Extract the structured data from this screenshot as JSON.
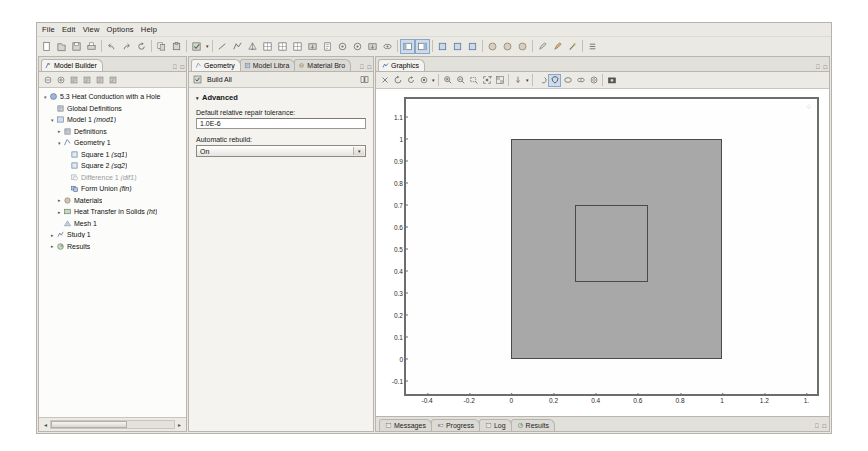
{
  "app": {
    "title": "COMSOL Multiphysics"
  },
  "menubar": {
    "items": [
      {
        "label": "File",
        "name": "menu-file"
      },
      {
        "label": "Edit",
        "name": "menu-edit"
      },
      {
        "label": "View",
        "name": "menu-view"
      },
      {
        "label": "Options",
        "name": "menu-options"
      },
      {
        "label": "Help",
        "name": "menu-help"
      }
    ]
  },
  "toolbar": {
    "groups": [
      {
        "buttons": [
          {
            "icon": "new-file-icon",
            "label": "New"
          },
          {
            "icon": "open-file-icon",
            "label": "Open"
          },
          {
            "icon": "save-icon",
            "label": "Save"
          },
          {
            "icon": "print-icon",
            "label": "Print"
          }
        ]
      },
      {
        "buttons": [
          {
            "icon": "undo-icon",
            "label": "Undo"
          },
          {
            "icon": "redo-icon",
            "label": "Redo"
          },
          {
            "icon": "refresh-icon",
            "label": "Refresh"
          }
        ]
      },
      {
        "buttons": [
          {
            "icon": "copy-icon",
            "label": "Copy"
          },
          {
            "icon": "paste-icon",
            "label": "Paste"
          }
        ]
      },
      {
        "buttons": [
          {
            "icon": "build-icon",
            "label": "Build"
          }
        ],
        "caret": true
      },
      {
        "buttons": [
          {
            "icon": "line-tool-icon",
            "label": "Line"
          },
          {
            "icon": "polygon-tool-icon",
            "label": "Polygon"
          },
          {
            "icon": "mesh-tool-icon",
            "label": "Mesh"
          },
          {
            "icon": "plot-1-icon",
            "label": "Plot"
          },
          {
            "icon": "plot-2-icon",
            "label": "Plot Group"
          },
          {
            "icon": "table-icon",
            "label": "Table"
          },
          {
            "icon": "export-icon",
            "label": "Export"
          },
          {
            "icon": "report-icon",
            "label": "Report"
          },
          {
            "icon": "probe-icon",
            "label": "Probe"
          },
          {
            "icon": "target-icon",
            "label": "Target"
          },
          {
            "icon": "import-icon",
            "label": "Import"
          },
          {
            "icon": "eye-icon",
            "label": "Show"
          }
        ]
      },
      {
        "buttons": [
          {
            "icon": "view-split-left-icon",
            "label": "Split Left",
            "active": true
          },
          {
            "icon": "view-split-right-icon",
            "label": "Split Right",
            "active": true
          }
        ]
      },
      {
        "buttons": [
          {
            "icon": "geom-1-icon",
            "label": "Geometry"
          },
          {
            "icon": "geom-2-icon",
            "label": "Geometry Sequence"
          },
          {
            "icon": "geom-3-icon",
            "label": "Work Plane"
          }
        ]
      },
      {
        "buttons": [
          {
            "icon": "material-1-icon",
            "label": "Material"
          },
          {
            "icon": "material-2-icon",
            "label": "Material Browser"
          },
          {
            "icon": "material-3-icon",
            "label": "Add Material"
          }
        ]
      },
      {
        "buttons": [
          {
            "icon": "pencil-icon",
            "label": "Edit"
          },
          {
            "icon": "brush-icon",
            "label": "Paint"
          },
          {
            "icon": "wand-icon",
            "label": "Select"
          }
        ]
      },
      {
        "buttons": [
          {
            "icon": "list-icon",
            "label": "List"
          }
        ]
      }
    ]
  },
  "model_builder": {
    "tab": {
      "label": "Model Builder",
      "icon": "model-builder-icon"
    },
    "tools": [
      {
        "icon": "collapse-icon",
        "label": "Collapse All"
      },
      {
        "icon": "expand-icon",
        "label": "Expand All"
      },
      {
        "icon": "tree-node-1-icon",
        "label": "Show Node"
      },
      {
        "icon": "tree-node-2-icon",
        "label": "Hide Node"
      },
      {
        "icon": "tree-node-3-icon",
        "label": "Node Options"
      },
      {
        "icon": "tree-node-4-icon",
        "label": "Tree Settings"
      }
    ],
    "tree": [
      {
        "indent": 0,
        "twist": "open",
        "icon": "model-root-icon",
        "label": "5.3 Heat Conduction with a Hole_",
        "name": "tree-item-root"
      },
      {
        "indent": 1,
        "twist": "none",
        "icon": "global-def-icon",
        "label": "Global Definitions",
        "name": "tree-item-global-definitions"
      },
      {
        "indent": 1,
        "twist": "open",
        "icon": "model-node-icon",
        "label": "Model 1 (mod1)",
        "name": "tree-item-model-1"
      },
      {
        "indent": 2,
        "twist": "closed",
        "icon": "definitions-icon",
        "label": "Definitions",
        "name": "tree-item-definitions"
      },
      {
        "indent": 2,
        "twist": "open",
        "icon": "geometry-icon",
        "label": "Geometry 1",
        "name": "tree-item-geometry-1"
      },
      {
        "indent": 3,
        "twist": "none",
        "icon": "square-icon",
        "label": "Square 1 (sq1)",
        "name": "tree-item-square-1"
      },
      {
        "indent": 3,
        "twist": "none",
        "icon": "square-icon",
        "label": "Square 2 (sq2)",
        "name": "tree-item-square-2"
      },
      {
        "indent": 3,
        "twist": "none",
        "icon": "difference-icon",
        "label": "Difference 1 (dif1)",
        "name": "tree-item-difference-1",
        "dim": true
      },
      {
        "indent": 3,
        "twist": "none",
        "icon": "form-union-icon",
        "label": "Form Union (fin)",
        "name": "tree-item-form-union"
      },
      {
        "indent": 2,
        "twist": "closed",
        "icon": "materials-icon",
        "label": "Materials",
        "name": "tree-item-materials"
      },
      {
        "indent": 2,
        "twist": "closed",
        "icon": "physics-icon",
        "label": "Heat Transfer in Solids (ht)",
        "name": "tree-item-heat-transfer"
      },
      {
        "indent": 2,
        "twist": "none",
        "icon": "mesh-icon",
        "label": "Mesh 1",
        "name": "tree-item-mesh-1"
      },
      {
        "indent": 1,
        "twist": "closed",
        "icon": "study-icon",
        "label": "Study 1",
        "name": "tree-item-study-1"
      },
      {
        "indent": 1,
        "twist": "closed",
        "icon": "results-icon",
        "label": "Results",
        "name": "tree-item-results"
      }
    ]
  },
  "settings": {
    "tabs": [
      {
        "label": "Geometry",
        "icon": "geometry-icon",
        "active": true,
        "name": "tab-geometry"
      },
      {
        "label": "Model Libra",
        "icon": "model-library-icon",
        "active": false,
        "name": "tab-model-library"
      },
      {
        "label": "Material Bro",
        "icon": "material-browser-icon",
        "active": false,
        "name": "tab-material-browser"
      }
    ],
    "build_all": {
      "label": "Build All",
      "icon": "build-all-icon"
    },
    "help_icon": "help-book-icon",
    "section": {
      "title": "Advanced"
    },
    "tolerance": {
      "label": "Default relative repair tolerance:",
      "value": "1.0E-6"
    },
    "automatic_rebuild": {
      "label": "Automatic rebuild:",
      "value": "On",
      "options": [
        "On",
        "Off"
      ]
    }
  },
  "graphics": {
    "tab": {
      "label": "Graphics",
      "icon": "graphics-icon"
    },
    "toolbar": [
      {
        "icon": "zoom-in-scene-icon",
        "label": "Zoom In Scene"
      },
      {
        "icon": "rotate-icon",
        "label": "Rotate"
      },
      {
        "icon": "refresh-view-icon",
        "label": "Refresh"
      },
      {
        "icon": "scene-light-icon",
        "label": "Scene Light"
      },
      {
        "caret": true
      },
      {
        "sep": true
      },
      {
        "icon": "zoom-in-icon",
        "label": "Zoom In"
      },
      {
        "icon": "zoom-out-icon",
        "label": "Zoom Out"
      },
      {
        "icon": "zoom-box-icon",
        "label": "Zoom Box"
      },
      {
        "icon": "zoom-extents-icon",
        "label": "Zoom Extents"
      },
      {
        "icon": "transparency-icon",
        "label": "Transparency"
      },
      {
        "sep": true
      },
      {
        "icon": "axis-orientation-icon",
        "label": "Go to View"
      },
      {
        "caret": true
      },
      {
        "sep": true
      },
      {
        "icon": "select-all-icon",
        "label": "Select All"
      },
      {
        "icon": "select-box-icon",
        "label": "Select Box",
        "active": true
      },
      {
        "icon": "select-circle-icon",
        "label": "Select Circle"
      },
      {
        "icon": "select-domain-icon",
        "label": "Select Domain"
      },
      {
        "icon": "select-boundary-icon",
        "label": "Select Boundary"
      },
      {
        "sep": true
      },
      {
        "icon": "image-snapshot-icon",
        "label": "Image Snapshot"
      }
    ],
    "chart_data": {
      "type": "scatter",
      "title": "",
      "xlabel": "",
      "ylabel": "",
      "xlim": [
        -0.5,
        1.45
      ],
      "ylim": [
        -0.16,
        1.18
      ],
      "grid": false,
      "xticks": [
        "-0.4",
        "-0.2",
        "0",
        "0.2",
        "0.4",
        "0.6",
        "0.8",
        "1",
        "1.2",
        "1."
      ],
      "xtick_values": [
        -0.4,
        -0.2,
        0,
        0.2,
        0.4,
        0.6,
        0.8,
        1.0,
        1.2,
        1.4
      ],
      "yticks": [
        "1.1",
        "1",
        "0.9",
        "0.8",
        "0.7",
        "0.6",
        "0.5",
        "0.4",
        "0.3",
        "0.2",
        "0.1",
        "0",
        "-0.1"
      ],
      "ytick_values": [
        1.1,
        1.0,
        0.9,
        0.8,
        0.7,
        0.6,
        0.5,
        0.4,
        0.3,
        0.2,
        0.1,
        0,
        -0.1
      ],
      "shapes": [
        {
          "name": "outer-square",
          "role": "Square 1 (sq1) domain",
          "x0": 0.0,
          "y0": 0.0,
          "x1": 1.0,
          "y1": 1.0,
          "fill": "#a8a8a8",
          "stroke": "#4a4a4a"
        },
        {
          "name": "inner-square",
          "role": "Square 2 (sq2) hole boundary",
          "x0": 0.3,
          "y0": 0.35,
          "x1": 0.65,
          "y1": 0.7,
          "fill": "none",
          "stroke": "#4a4a4a"
        }
      ]
    }
  },
  "status": {
    "tabs": [
      {
        "label": "Messages",
        "icon": "messages-icon",
        "name": "status-tab-messages"
      },
      {
        "label": "Progress",
        "icon": "progress-icon",
        "name": "status-tab-progress"
      },
      {
        "label": "Log",
        "icon": "log-icon",
        "name": "status-tab-log"
      },
      {
        "label": "Results",
        "icon": "results-icon",
        "name": "status-tab-results"
      }
    ]
  },
  "colors": {
    "chrome": "#ebe9e4",
    "panel": "#f4f3f0",
    "border": "#b9b5ae",
    "accent": "#cddcec",
    "geometry_fill": "#a8a8a8",
    "geometry_stroke": "#4a4a4a"
  }
}
